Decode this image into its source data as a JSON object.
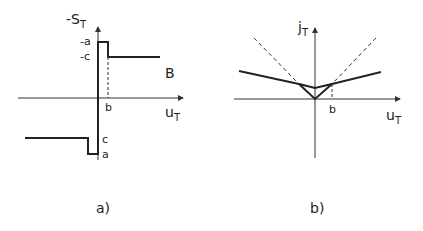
{
  "panel_a": {
    "caption": "a)",
    "y_label": "-S",
    "y_sub": "T",
    "x_label": "u",
    "x_sub": "T",
    "tick_neg_a": "-a",
    "tick_neg_c": "-c",
    "tick_a": "a",
    "tick_c": "c",
    "tick_b": "b",
    "curve_label": "B"
  },
  "panel_b": {
    "caption": "b)",
    "y_label": "j",
    "y_sub": "T",
    "x_label": "u",
    "x_sub": "T",
    "tick_b": "b"
  }
}
